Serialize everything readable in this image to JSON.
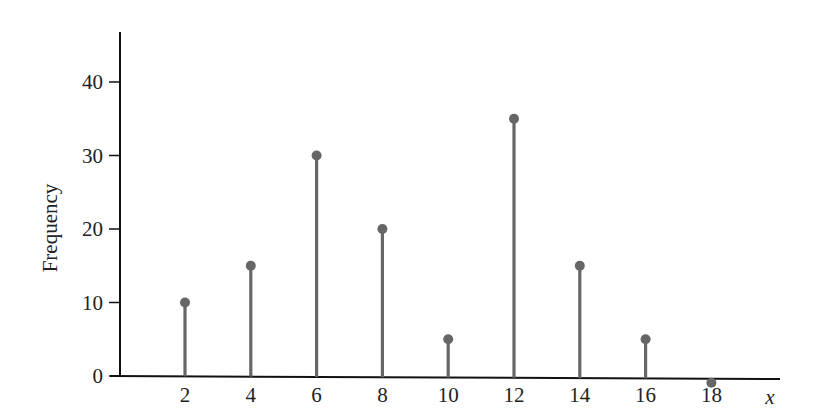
{
  "chart_data": {
    "type": "stem",
    "title": "",
    "xlabel": "x",
    "ylabel": "Frequency",
    "x": [
      2,
      4,
      6,
      8,
      10,
      12,
      14,
      16,
      18
    ],
    "values": [
      10,
      15,
      30,
      20,
      5,
      35,
      15,
      5,
      0
    ],
    "x_ticks": [
      "2",
      "4",
      "6",
      "8",
      "10",
      "12",
      "14",
      "16",
      "18"
    ],
    "y_ticks": [
      "0",
      "10",
      "20",
      "30",
      "40"
    ],
    "ylim": [
      0,
      46
    ],
    "grid": false,
    "legend": null,
    "colors": {
      "stem": "#666666",
      "axis": "#111111",
      "text": "#222222"
    }
  }
}
